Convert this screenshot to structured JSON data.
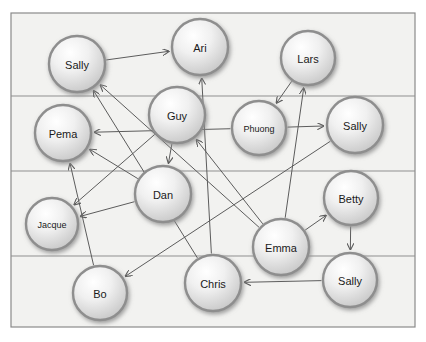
{
  "canvas": {
    "width": 426,
    "height": 342,
    "background": "#ffffff"
  },
  "frame": {
    "x": 11,
    "y": 13,
    "width": 404,
    "height": 314,
    "stroke": "#8a8a8a",
    "fill": "#f2f2f0",
    "stroke_width": 1.2
  },
  "band_lines": {
    "label": "horizontal-band-separators",
    "stroke": "#8f8f8f",
    "stroke_width": 1,
    "y_values": [
      96,
      171,
      256
    ]
  },
  "style": {
    "node_radius": 28,
    "node_stroke": "#8e8e8e",
    "node_stroke_width": 2.4,
    "node_fill_light": "#fcfcfc",
    "node_fill_dark": "#c9c9c9",
    "node_shadow": "#9a9a9a",
    "edge_stroke": "#5c5c5c",
    "edge_stroke_width": 1.0,
    "label_color": "#1a1a1a",
    "label_font_size": 11,
    "label_font_size_small": 9
  },
  "graph_data": {
    "type": "directed-node-link-diagram",
    "node_count": 14,
    "edge_count": 18,
    "nodes": [
      {
        "id": "sally_tl",
        "label": "Sally",
        "x": 77,
        "y": 64,
        "r": 28,
        "font": 11,
        "band": 0
      },
      {
        "id": "ari",
        "label": "Ari",
        "x": 200,
        "y": 47,
        "r": 28,
        "font": 11,
        "band": 0
      },
      {
        "id": "lars",
        "label": "Lars",
        "x": 308,
        "y": 58,
        "r": 27,
        "font": 11,
        "band": 0
      },
      {
        "id": "guy",
        "label": "Guy",
        "x": 177,
        "y": 115,
        "r": 28,
        "font": 11,
        "band": 1
      },
      {
        "id": "phuong",
        "label": "Phuong",
        "x": 259,
        "y": 128,
        "r": 27,
        "font": 9,
        "band": 1
      },
      {
        "id": "sally_r",
        "label": "Sally",
        "x": 355,
        "y": 125,
        "r": 28,
        "font": 11,
        "band": 1
      },
      {
        "id": "pema",
        "label": "Pema",
        "x": 63,
        "y": 133,
        "r": 28,
        "font": 11,
        "band": 1
      },
      {
        "id": "dan",
        "label": "Dan",
        "x": 163,
        "y": 194,
        "r": 28,
        "font": 11,
        "band": 2
      },
      {
        "id": "betty",
        "label": "Betty",
        "x": 351,
        "y": 198,
        "r": 27,
        "font": 11,
        "band": 2
      },
      {
        "id": "jacque",
        "label": "Jacque",
        "x": 52,
        "y": 224,
        "r": 26,
        "font": 9,
        "band": 2
      },
      {
        "id": "emma",
        "label": "Emma",
        "x": 281,
        "y": 247,
        "r": 28,
        "font": 11,
        "band": 2
      },
      {
        "id": "chris",
        "label": "Chris",
        "x": 213,
        "y": 283,
        "r": 28,
        "font": 11,
        "band": 3
      },
      {
        "id": "sally_b",
        "label": "Sally",
        "x": 350,
        "y": 280,
        "r": 27,
        "font": 11,
        "band": 3
      },
      {
        "id": "bo",
        "label": "Bo",
        "x": 100,
        "y": 293,
        "r": 27,
        "font": 11,
        "band": 3
      }
    ],
    "edges": [
      {
        "from": "sally_tl",
        "to": "ari",
        "directed": true
      },
      {
        "from": "lars",
        "to": "phuong",
        "directed": true
      },
      {
        "from": "phuong",
        "to": "sally_r",
        "directed": true
      },
      {
        "from": "emma",
        "to": "lars",
        "directed": true
      },
      {
        "from": "emma",
        "to": "betty",
        "directed": true
      },
      {
        "from": "betty",
        "to": "sally_b",
        "directed": true
      },
      {
        "from": "sally_b",
        "to": "chris",
        "directed": true
      },
      {
        "from": "emma",
        "to": "guy",
        "directed": true
      },
      {
        "from": "emma",
        "to": "sally_tl",
        "directed": true
      },
      {
        "from": "phuong",
        "to": "pema",
        "directed": true
      },
      {
        "from": "sally_r",
        "to": "bo",
        "directed": true
      },
      {
        "from": "guy",
        "to": "jacque",
        "directed": true
      },
      {
        "from": "guy",
        "to": "dan",
        "directed": true
      },
      {
        "from": "dan",
        "to": "jacque",
        "directed": true
      },
      {
        "from": "dan",
        "to": "pema",
        "directed": true
      },
      {
        "from": "chris",
        "to": "ari",
        "directed": true
      },
      {
        "from": "chris",
        "to": "sally_tl",
        "directed": true
      },
      {
        "from": "bo",
        "to": "pema",
        "directed": true
      }
    ]
  }
}
